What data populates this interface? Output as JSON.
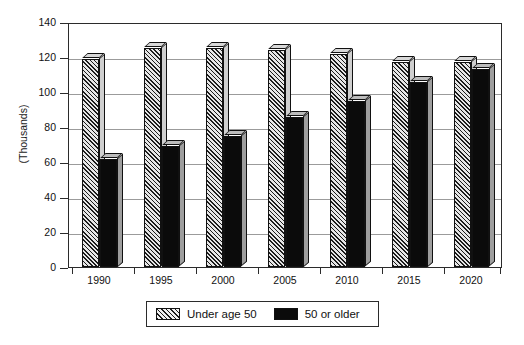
{
  "chart_data": {
    "type": "bar",
    "title": "",
    "xlabel": "",
    "ylabel": "(Thousands)",
    "categories": [
      "1990",
      "1995",
      "2000",
      "2005",
      "2010",
      "2015",
      "2020"
    ],
    "series": [
      {
        "name": "Under age 50",
        "values": [
          119,
          125,
          125,
          124,
          122,
          117,
          117
        ],
        "pattern": "diagonal-hatch",
        "color": "#c9c9c9"
      },
      {
        "name": "50 or older",
        "values": [
          62,
          69,
          75,
          86,
          95,
          106,
          113
        ],
        "pattern": "solid",
        "color": "#0b0b0b"
      }
    ],
    "ylim": [
      0,
      140
    ],
    "yticks": [
      0,
      20,
      40,
      60,
      80,
      100,
      120,
      140
    ],
    "ytick_labels": [
      "0",
      "20",
      "40",
      "60",
      "80",
      "100",
      "120",
      "140"
    ],
    "grid": true,
    "grid_axis": "y",
    "legend_position": "bottom",
    "style": "3d-bar"
  },
  "legend": {
    "entries": [
      {
        "label": "Under age 50",
        "swatch": "hatch-swatch"
      },
      {
        "label": "50 or older",
        "swatch": "solid-swatch"
      }
    ]
  }
}
